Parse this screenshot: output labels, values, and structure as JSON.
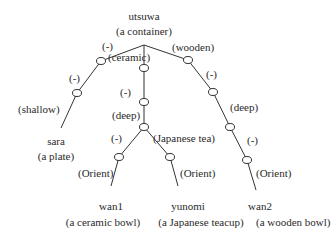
{
  "root": {
    "word": "utsuwa",
    "gloss": "(a container)"
  },
  "edges": {
    "left_top": "(-)",
    "ceramic": "(ceramic)",
    "wooden": "(wooden)",
    "left_mid": "(-)",
    "shallow": "(shallow)",
    "center_mid": "(-)",
    "center_deep": "(deep)",
    "fork_left": "(-)",
    "japanese_tea": "(Japanese tea)",
    "right_mid1": "(-)",
    "right_deep": "(deep)",
    "right_mid2": "(-)",
    "orient_wan1": "(Orient)",
    "orient_yunomi": "(Orient)",
    "orient_wan2": "(Orient)"
  },
  "leaves": [
    {
      "word": "sara",
      "gloss": "(a plate)"
    },
    {
      "word": "wan1",
      "gloss": "(a ceramic bowl)"
    },
    {
      "word": "yunomi",
      "gloss": "(a Japanese teacup)"
    },
    {
      "word": "wan2",
      "gloss": "(a wooden bowl)"
    }
  ]
}
